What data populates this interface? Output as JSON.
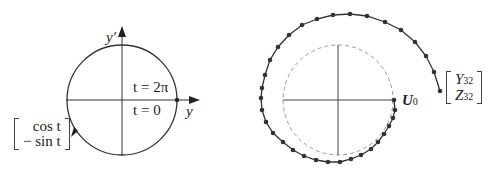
{
  "left_figure": {
    "axis_labels": {
      "horizontal": "y",
      "vertical": "y′"
    },
    "annotations": {
      "upper": "t = 2π",
      "lower": "t = 0"
    },
    "vector": {
      "top": "cos t",
      "bottom": "− sin t"
    },
    "circle": {
      "cx": 122,
      "cy": 100,
      "r": 55
    }
  },
  "right_figure": {
    "start_label": "U",
    "start_subscript": "0",
    "end_vector": {
      "top": "Y",
      "top_sub": "32",
      "bottom": "Z",
      "bottom_sub": "32"
    },
    "dashed_circle": {
      "cx": 338,
      "cy": 100,
      "r": 55
    },
    "points": [
      [
        394,
        100
      ],
      [
        395,
        110
      ],
      [
        393,
        118
      ],
      [
        389,
        126
      ],
      [
        384,
        134
      ],
      [
        378,
        142
      ],
      [
        371,
        149
      ],
      [
        361,
        155
      ],
      [
        351,
        159
      ],
      [
        340,
        162
      ],
      [
        328,
        162
      ],
      [
        316,
        160
      ],
      [
        304,
        156
      ],
      [
        293,
        150
      ],
      [
        283,
        142
      ],
      [
        273,
        133
      ],
      [
        266,
        122
      ],
      [
        262,
        110
      ],
      [
        261,
        98
      ],
      [
        262,
        88
      ],
      [
        265,
        75
      ],
      [
        270,
        60
      ],
      [
        278,
        47
      ],
      [
        289,
        35
      ],
      [
        302,
        25
      ],
      [
        317,
        19
      ],
      [
        333,
        15
      ],
      [
        350,
        14
      ],
      [
        367,
        16
      ],
      [
        385,
        22
      ],
      [
        401,
        30
      ],
      [
        415,
        42
      ],
      [
        426,
        56
      ],
      [
        434,
        72
      ],
      [
        440,
        91
      ]
    ]
  }
}
